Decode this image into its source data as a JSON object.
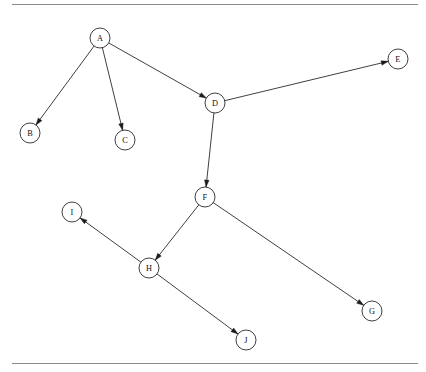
{
  "figure": {
    "width": 426,
    "height": 372,
    "background_color": "#ffffff",
    "node_fill_color": "#ffffff",
    "node_stroke_color": "#1d1d1d",
    "edge_color": "#1d1d1d",
    "rule_color": "#8a8a8a",
    "label_color": "#111111",
    "node_radius": 10
  },
  "rules": [
    {
      "name": "top-rule",
      "x1": 12,
      "y1": 4.5,
      "x2": 418,
      "y2": 4.5
    },
    {
      "name": "bottom-rule",
      "x1": 12,
      "y1": 363.5,
      "x2": 418,
      "y2": 363.5
    }
  ],
  "nodes": [
    {
      "id": "A",
      "label": "A",
      "cx": 100,
      "cy": 38
    },
    {
      "id": "B",
      "label": "B",
      "cx": 30,
      "cy": 133
    },
    {
      "id": "C",
      "label": "C",
      "cx": 125,
      "cy": 140
    },
    {
      "id": "D",
      "label": "D",
      "cx": 215,
      "cy": 103
    },
    {
      "id": "E",
      "label": "E",
      "cx": 398,
      "cy": 59
    },
    {
      "id": "F",
      "label": "F",
      "cx": 205,
      "cy": 197
    },
    {
      "id": "G",
      "label": "G",
      "cx": 372,
      "cy": 311
    },
    {
      "id": "H",
      "label": "H",
      "cx": 149,
      "cy": 268
    },
    {
      "id": "I",
      "label": "I",
      "cx": 72,
      "cy": 212
    },
    {
      "id": "J",
      "label": "J",
      "cx": 246,
      "cy": 340
    }
  ],
  "edges": [
    {
      "id": "A-B",
      "from": "A",
      "to": "B",
      "directed": true
    },
    {
      "id": "A-C",
      "from": "A",
      "to": "C",
      "directed": true
    },
    {
      "id": "A-D",
      "from": "A",
      "to": "D",
      "directed": true
    },
    {
      "id": "D-E",
      "from": "D",
      "to": "E",
      "directed": true
    },
    {
      "id": "D-F",
      "from": "D",
      "to": "F",
      "directed": true
    },
    {
      "id": "F-H",
      "from": "F",
      "to": "H",
      "directed": true
    },
    {
      "id": "F-G",
      "from": "F",
      "to": "G",
      "directed": true
    },
    {
      "id": "H-I",
      "from": "H",
      "to": "I",
      "directed": true
    },
    {
      "id": "H-J",
      "from": "H",
      "to": "J",
      "directed": true
    }
  ]
}
